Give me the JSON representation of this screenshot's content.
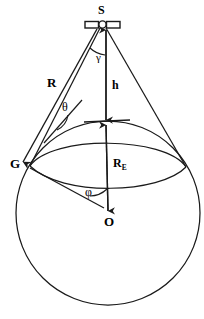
{
  "figure": {
    "stroke_color": "#1a1a1a",
    "background_color": "#ffffff"
  },
  "labels": {
    "satellite": "S",
    "ground_point": "G",
    "earth_centre": "O",
    "slant_range": "R",
    "altitude": "h",
    "earth_radius_main": "R",
    "earth_radius_sub": "E",
    "nadir_angle": "γ",
    "elevation_angle": "θ",
    "geocentric_angle": "φ"
  },
  "geometry": {
    "satellite_point": {
      "x": 102,
      "y": 25
    },
    "earth_centre_point": {
      "x": 108,
      "y": 212
    },
    "ground_point": {
      "x": 30,
      "y": 166
    },
    "earth_radius_px": 92,
    "subsatellite_point": {
      "x": 106,
      "y": 122
    },
    "horizon_right_point": {
      "x": 186,
      "y": 167
    }
  }
}
